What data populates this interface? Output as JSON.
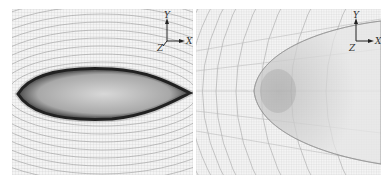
{
  "figure": {
    "panels": [
      {
        "id": "left",
        "description": "Structured O-type mesh around an elongated airfoil/body cross-section (full view)",
        "axis_triad": {
          "y_label": "Y",
          "x_label": "X",
          "z_label": "Z"
        }
      },
      {
        "id": "right",
        "description": "Zoomed view of mesh near leading edge showing grid refinement",
        "axis_triad": {
          "y_label": "Y",
          "x_label": "X",
          "z_label": "Z"
        }
      }
    ],
    "colors": {
      "background": "#ffffff",
      "panel_bg": "#f4f4f4",
      "grid_line": "#9a9a9a",
      "dense_mesh": "#1a1a1a"
    }
  }
}
